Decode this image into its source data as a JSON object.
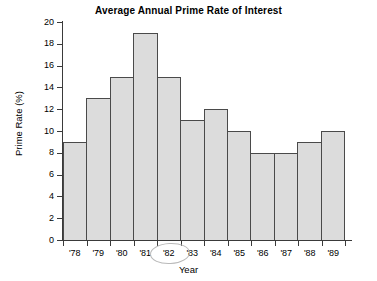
{
  "chart_data": {
    "type": "bar",
    "title": "Average Annual Prime Rate of Interest",
    "xlabel": "Year",
    "ylabel": "Prime Rate (%)",
    "categories": [
      "'78",
      "'79",
      "'80",
      "'81",
      "'82",
      "'83",
      "'84",
      "'85",
      "'86",
      "'87",
      "'88",
      "'89"
    ],
    "values": [
      9,
      13,
      15,
      19,
      15,
      11,
      12,
      10,
      8,
      8,
      9,
      10
    ],
    "ylim": [
      0,
      20
    ],
    "ytick_step": 2,
    "yticks": [
      0,
      2,
      4,
      6,
      8,
      10,
      12,
      14,
      16,
      18,
      20
    ],
    "ytick_labels": [
      "0",
      "2",
      "4",
      "6",
      "8",
      "10",
      "12",
      "14",
      "16",
      "18",
      "20"
    ],
    "grid": false,
    "legend": null,
    "bar_fill_color": "#dcdcdc",
    "bar_border_color": "#4a4a4a",
    "axis_color": "#3a3a3a",
    "background_color": "#ffffff",
    "annotations": [
      {
        "name": "hand-drawn-ellipse",
        "shape": "ellipse",
        "target_category": "'82",
        "color": "#b9b9b9"
      }
    ]
  }
}
